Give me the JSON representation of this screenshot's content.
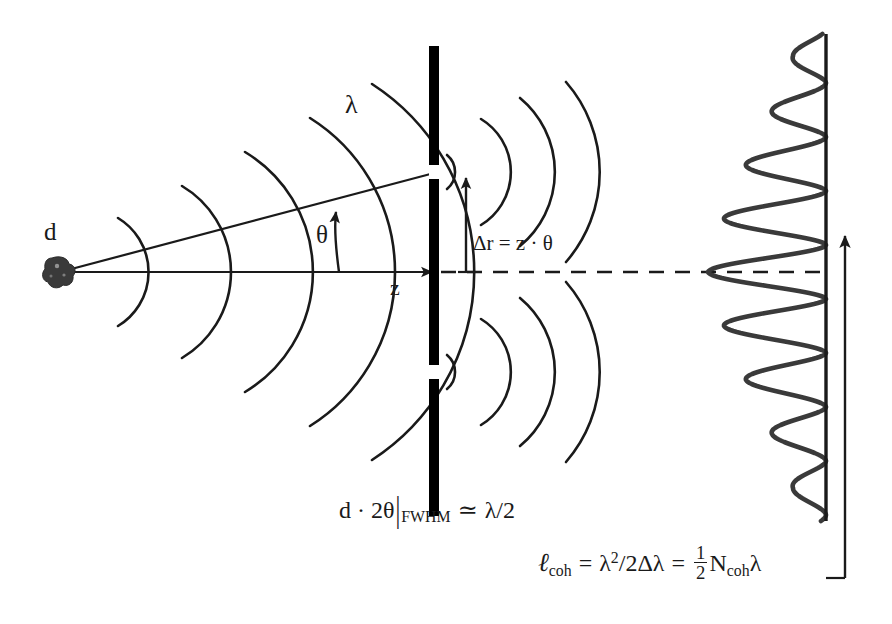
{
  "figure": {
    "width": 892,
    "height": 624,
    "background": "#ffffff",
    "ink": "#1a1a1a"
  },
  "labels": {
    "source_size": "d",
    "wavelength": "λ",
    "angle": "θ",
    "distance": "z",
    "path_difference_lhs": "Δr",
    "path_difference_eq": "=",
    "path_difference_rhs": "z · θ",
    "path_difference_full": "Δr = z · θ"
  },
  "equations": {
    "fwhm": {
      "full": "d · 2θ|FWHM ≃ λ/2",
      "lead": "d · 2θ",
      "bar": "|",
      "subscript": "FWHM",
      "relation": "≃",
      "rhs": "λ/2"
    },
    "coherence": {
      "full": "ℓcoh = λ²/2Δλ = ½ Ncohλ",
      "symbol": "ℓ",
      "symbol_sub": "coh",
      "eq1": "=",
      "term1_base": "λ",
      "term1_exp": "2",
      "term1_rest": "/2Δλ",
      "eq2": "=",
      "frac_num": "1",
      "frac_den": "2",
      "term2_base": "N",
      "term2_sub": "coh",
      "term2_tail": "λ"
    }
  },
  "elements": {
    "source_blob": "point-source",
    "barrier": "double-slit-barrier",
    "slit_upper": "upper-slit",
    "slit_lower": "lower-slit",
    "screen": "detection-screen",
    "axis": "optical-axis",
    "ray": "diagonal-ray",
    "centerline": "dashed-centerline",
    "theta_arrow": "theta-angle-arrow",
    "dr_arrow": "path-difference-arrow",
    "lcoh_arrow": "coherence-length-arrow"
  },
  "geometry": {
    "source": {
      "x": 57,
      "y": 272
    },
    "barrier_x": 434,
    "barrier_top": 46,
    "barrier_bottom": 516,
    "slit_upper_y": 172,
    "slit_lower_y": 372,
    "screen_x": 826,
    "screen_top": 34,
    "screen_bottom": 521,
    "axis_y": 272,
    "incident_wavefront_count": 5,
    "diffracted_arc_count": 4
  },
  "chart_data": {
    "type": "line",
    "orientation": "vertical",
    "xlabel": "",
    "ylabel": "",
    "baseline_x": 826,
    "axis_y_center": 272,
    "fringe_spacing_px": 54,
    "peaks": [
      {
        "order": -4,
        "y": 56,
        "peak_x": 793,
        "amplitude": 33
      },
      {
        "order": -3,
        "y": 110,
        "peak_x": 772,
        "amplitude": 54
      },
      {
        "order": -2,
        "y": 164,
        "peak_x": 746,
        "amplitude": 80
      },
      {
        "order": -1,
        "y": 218,
        "peak_x": 724,
        "amplitude": 102
      },
      {
        "order": 0,
        "y": 272,
        "peak_x": 708,
        "amplitude": 118
      },
      {
        "order": 1,
        "y": 326,
        "peak_x": 724,
        "amplitude": 102
      },
      {
        "order": 2,
        "y": 380,
        "peak_x": 746,
        "amplitude": 80
      },
      {
        "order": 3,
        "y": 434,
        "peak_x": 772,
        "amplitude": 54
      },
      {
        "order": 4,
        "y": 488,
        "peak_x": 793,
        "amplitude": 33
      }
    ],
    "values": [
      33,
      54,
      80,
      102,
      118,
      102,
      80,
      54,
      33
    ],
    "categories": [
      "-4",
      "-3",
      "-2",
      "-1",
      "0",
      "1",
      "2",
      "3",
      "4"
    ],
    "grid": false,
    "legend": false
  }
}
